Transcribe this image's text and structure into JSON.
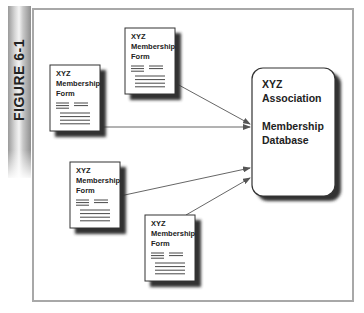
{
  "figure": {
    "label": "FIGURE 6-1"
  },
  "forms": [
    {
      "lines": [
        "XYZ",
        "Membership",
        "Form"
      ]
    },
    {
      "lines": [
        "XYZ",
        "Membership",
        "Form"
      ]
    },
    {
      "lines": [
        "XYZ",
        "Membership",
        "Form"
      ]
    },
    {
      "lines": [
        "XYZ",
        "Membership",
        "Form"
      ]
    }
  ],
  "database": {
    "lines": [
      "XYZ",
      "Association",
      "",
      "Membership",
      "Database"
    ]
  },
  "colors": {
    "frame": "#a8a8a8",
    "arrow": "#555555",
    "shadow": "#333333",
    "text": "#222222"
  }
}
